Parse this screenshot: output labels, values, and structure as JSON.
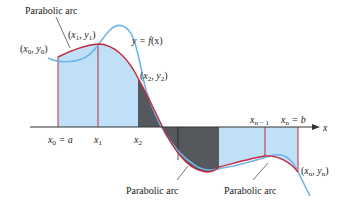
{
  "diagram": {
    "colors": {
      "light_fill": "#bfe0f7",
      "dark_fill": "#55585c",
      "curve_f": "#6fb6e6",
      "parabola": "#c8283c",
      "axis": "#333333",
      "text": "#222222"
    },
    "function_label": {
      "prefix": "y = ",
      "func": "f",
      "arg": "(x)"
    },
    "axis_label": "x",
    "annotations": [
      {
        "id": "top-left",
        "text": "Parabolic arc"
      },
      {
        "id": "bottom-middle",
        "text": "Parabolic arc"
      },
      {
        "id": "bottom-right",
        "text": "Parabolic arc"
      }
    ],
    "points": [
      {
        "id": "p0",
        "x": "x",
        "xs": "0",
        "y": "y",
        "ys": "0"
      },
      {
        "id": "p1",
        "x": "x",
        "xs": "1",
        "y": "y",
        "ys": "1"
      },
      {
        "id": "p2",
        "x": "x",
        "xs": "2",
        "y": "y",
        "ys": "2"
      },
      {
        "id": "pn",
        "x": "x",
        "xs": "n",
        "y": "y",
        "ys": "n"
      }
    ],
    "ticks": [
      {
        "var": "x",
        "sub": "0",
        "suffix": " = a"
      },
      {
        "var": "x",
        "sub": "1",
        "suffix": ""
      },
      {
        "var": "x",
        "sub": "2",
        "suffix": ""
      },
      {
        "var": "x",
        "sub": "n − 1",
        "suffix": ""
      },
      {
        "var": "x",
        "sub": "n",
        "suffix": " = b"
      }
    ],
    "punct": {
      "open": "(",
      "comma": ", ",
      "close": ")"
    }
  }
}
